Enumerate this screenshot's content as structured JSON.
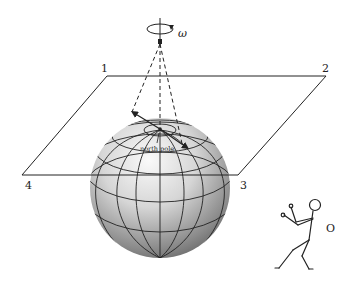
{
  "diagram": {
    "type": "foucault-pendulum-sphere",
    "rotation_symbol": "ω",
    "pole_label": "north pole",
    "observer_label": "O",
    "plane_corners": [
      {
        "label": "1",
        "x": 107,
        "y": 76
      },
      {
        "label": "2",
        "x": 326,
        "y": 76
      },
      {
        "label": "3",
        "x": 238,
        "y": 175
      },
      {
        "label": "4",
        "x": 22,
        "y": 175
      }
    ],
    "colors": {
      "line": "#222222",
      "sphere_light": "#f4f4f4",
      "sphere_dark": "#6e6e6e",
      "background": "#ffffff"
    }
  }
}
